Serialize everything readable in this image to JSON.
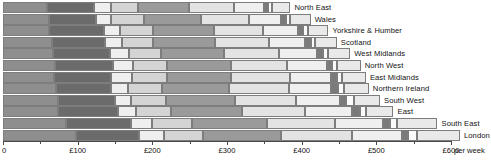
{
  "chart_data": {
    "type": "bar",
    "orientation": "horizontal",
    "stacked": true,
    "title": "",
    "subtitle": "",
    "xlabel": "£ per week",
    "ylabel": "",
    "xlim": [
      0,
      600
    ],
    "grid": false,
    "legend_position": "none",
    "axis_unit_label": "per week",
    "tick_labels": [
      "0",
      "£100",
      "£200",
      "£300",
      "£400",
      "£500",
      "£600"
    ],
    "tick_values": [
      0,
      100,
      200,
      300,
      400,
      500,
      600
    ],
    "minor_tick_values": [
      50,
      150,
      250,
      350,
      450,
      550
    ],
    "categories": [
      "North East",
      "Wales",
      "Yorkshire & Humber",
      "Scotland",
      "West Midlands",
      "North West",
      "East Midlands",
      "Northern Ireland",
      "South West",
      "East",
      "South East",
      "London"
    ],
    "series": [
      {
        "name": "segment-1",
        "color": "#8e8e8e",
        "values": [
          59,
          61,
          62,
          66,
          67,
          69,
          68,
          71,
          73,
          74,
          84,
          98
        ]
      },
      {
        "name": "segment-2",
        "color": "#6b6b6b",
        "values": [
          63,
          64,
          73,
          70,
          76,
          78,
          77,
          73,
          77,
          80,
          87,
          84
        ]
      },
      {
        "name": "segment-3",
        "color": "#efefef",
        "values": [
          23,
          20,
          22,
          23,
          26,
          27,
          28,
          23,
          22,
          24,
          29,
          34
        ]
      },
      {
        "name": "segment-4",
        "color": "#d4d4d4",
        "values": [
          36,
          44,
          44,
          42,
          43,
          45,
          46,
          46,
          47,
          47,
          53,
          52
        ]
      },
      {
        "name": "segment-5",
        "color": "#9a9a9a",
        "values": [
          68,
          76,
          81,
          83,
          84,
          86,
          87,
          90,
          92,
          95,
          100,
          104
        ]
      },
      {
        "name": "segment-6",
        "color": "#e3e3e3",
        "values": [
          61,
          65,
          66,
          72,
          74,
          76,
          78,
          80,
          82,
          85,
          92,
          96
        ]
      },
      {
        "name": "segment-7",
        "color": "#efefef",
        "values": [
          39,
          43,
          47,
          49,
          51,
          53,
          55,
          57,
          59,
          62,
          64,
          66
        ]
      },
      {
        "name": "segment-8",
        "color": "#7a7a7a",
        "values": [
          6,
          6,
          7,
          7,
          7,
          7,
          8,
          9,
          8,
          11,
          10,
          9
        ]
      },
      {
        "name": "segment-9",
        "color": "#fbfbfb",
        "values": [
          5,
          6,
          6,
          6,
          7,
          7,
          7,
          8,
          10,
          8,
          9,
          11
        ]
      },
      {
        "name": "segment-10",
        "color": "#e9e9e9",
        "values": [
          25,
          27,
          28,
          29,
          30,
          31,
          32,
          33,
          35,
          37,
          54,
          58
        ]
      }
    ],
    "totals": [
      385,
      412,
      436,
      447,
      465,
      479,
      486,
      490,
      505,
      523,
      582,
      612
    ]
  },
  "axis": {
    "unit_suffix": "per week"
  }
}
